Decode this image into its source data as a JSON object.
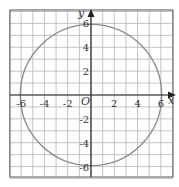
{
  "chart_data": {
    "type": "line",
    "title": "",
    "xlabel": "x",
    "ylabel": "y",
    "origin_label": "O",
    "xlim": [
      -7,
      7
    ],
    "ylim": [
      -7,
      7
    ],
    "grid": true,
    "grid_step": 1,
    "x_ticks": [
      "-6",
      "-4",
      "-2",
      "2",
      "4",
      "6"
    ],
    "y_ticks": [
      "6",
      "4",
      "2",
      "-2",
      "-4",
      "-6"
    ],
    "series": [
      {
        "name": "circle",
        "shape": "circle",
        "center": [
          0,
          0
        ],
        "radius": 6,
        "color": "#8a8a8a"
      }
    ]
  },
  "colors": {
    "grid": "#b5b5b5",
    "axis": "#222222",
    "curve": "#8a8a8a",
    "border": "#555555"
  }
}
